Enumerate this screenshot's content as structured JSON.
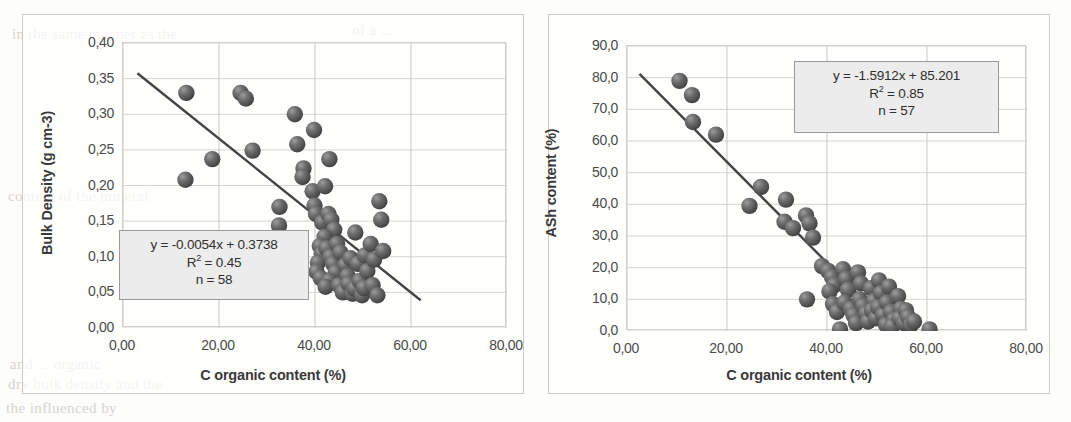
{
  "figure": {
    "panels": [
      "bulk-density-panel",
      "ash-content-panel"
    ],
    "background_ghost_text": [
      {
        "text": "in the same manner as the",
        "x": 12,
        "y": 26
      },
      {
        "text": "of a ...",
        "x": 352,
        "y": 22
      },
      {
        "text": "content of the mineral",
        "x": 8,
        "y": 188
      },
      {
        "text": "and ... organic",
        "x": 10,
        "y": 356
      },
      {
        "text": "dry bulk density and the",
        "x": 8,
        "y": 376
      },
      {
        "text": "the influenced by",
        "x": 6,
        "y": 400
      }
    ]
  },
  "chart_data": [
    {
      "id": "bulk-density",
      "type": "scatter",
      "title": "",
      "xlabel": "C organic content (%)",
      "ylabel": "Bulk Density (g cm-3)",
      "xlim": [
        0,
        80
      ],
      "ylim": [
        0,
        0.4
      ],
      "xticks": [
        "0,00",
        "20,00",
        "40,00",
        "60,00",
        "80,00"
      ],
      "xtick_values": [
        0,
        20,
        40,
        60,
        80
      ],
      "yticks": [
        "0,00",
        "0,05",
        "0,10",
        "0,15",
        "0,20",
        "0,25",
        "0,30",
        "0,35",
        "0,40"
      ],
      "ytick_values": [
        0,
        0.05,
        0.1,
        0.15,
        0.2,
        0.25,
        0.3,
        0.35,
        0.4
      ],
      "grid": true,
      "marker_color": "#5d5d5d",
      "trendline_color": "#444444",
      "annotation": {
        "equation": "y = -0.0054x + 0.3738",
        "r2_label": "R",
        "r2_exp": "2",
        "r2_value": " = 0.45",
        "n": "n = 58"
      },
      "trendline": {
        "slope": -0.0054,
        "intercept": 0.3738,
        "x_start": 3.0,
        "x_end": 62.0
      },
      "points": [
        [
          13.2,
          0.33
        ],
        [
          13.0,
          0.208
        ],
        [
          18.6,
          0.237
        ],
        [
          24.5,
          0.33
        ],
        [
          25.6,
          0.322
        ],
        [
          27.0,
          0.249
        ],
        [
          32.6,
          0.17
        ],
        [
          32.5,
          0.144
        ],
        [
          35.8,
          0.3
        ],
        [
          36.3,
          0.258
        ],
        [
          37.6,
          0.224
        ],
        [
          37.4,
          0.212
        ],
        [
          39.8,
          0.278
        ],
        [
          39.5,
          0.192
        ],
        [
          39.9,
          0.172
        ],
        [
          40.2,
          0.16
        ],
        [
          43.0,
          0.237
        ],
        [
          42.1,
          0.199
        ],
        [
          41.5,
          0.148
        ],
        [
          42.8,
          0.16
        ],
        [
          43.4,
          0.152
        ],
        [
          44.0,
          0.138
        ],
        [
          42.0,
          0.128
        ],
        [
          41.0,
          0.115
        ],
        [
          41.4,
          0.104
        ],
        [
          40.6,
          0.092
        ],
        [
          40.3,
          0.079
        ],
        [
          41.2,
          0.07
        ],
        [
          42.4,
          0.112
        ],
        [
          43.2,
          0.1
        ],
        [
          43.8,
          0.09
        ],
        [
          44.3,
          0.078
        ],
        [
          43.0,
          0.066
        ],
        [
          42.2,
          0.058
        ],
        [
          44.6,
          0.118
        ],
        [
          45.3,
          0.106
        ],
        [
          45.0,
          0.06
        ],
        [
          45.8,
          0.05
        ],
        [
          46.3,
          0.088
        ],
        [
          46.8,
          0.073
        ],
        [
          47.4,
          0.098
        ],
        [
          47.0,
          0.062
        ],
        [
          47.8,
          0.048
        ],
        [
          48.4,
          0.134
        ],
        [
          48.9,
          0.09
        ],
        [
          48.2,
          0.055
        ],
        [
          49.3,
          0.066
        ],
        [
          49.8,
          0.046
        ],
        [
          50.4,
          0.102
        ],
        [
          50.9,
          0.08
        ],
        [
          50.2,
          0.056
        ],
        [
          51.6,
          0.118
        ],
        [
          52.3,
          0.096
        ],
        [
          52.0,
          0.06
        ],
        [
          53.4,
          0.178
        ],
        [
          53.8,
          0.152
        ],
        [
          54.2,
          0.108
        ],
        [
          53.0,
          0.046
        ]
      ]
    },
    {
      "id": "ash-content",
      "type": "scatter",
      "title": "",
      "xlabel": "C organic content (%)",
      "ylabel": "ASh content (%)",
      "xlim": [
        0,
        80
      ],
      "ylim": [
        0,
        90
      ],
      "xticks": [
        "0,00",
        "20,00",
        "40,00",
        "60,00",
        "80,00"
      ],
      "xtick_values": [
        0,
        20,
        40,
        60,
        80
      ],
      "yticks": [
        "0,0",
        "10,0",
        "20,0",
        "30,0",
        "40,0",
        "50,0",
        "60,0",
        "70,0",
        "80,0",
        "90,0"
      ],
      "ytick_values": [
        0,
        10,
        20,
        30,
        40,
        50,
        60,
        70,
        80,
        90
      ],
      "grid": true,
      "marker_color": "#5d5d5d",
      "trendline_color": "#444444",
      "annotation": {
        "equation": "y = -1.5912x + 85.201",
        "r2_label": "R",
        "r2_exp": "2",
        "r2_value": " = 0.85",
        "n": "n = 57"
      },
      "trendline": {
        "slope": -1.5912,
        "intercept": 85.201,
        "x_start": 2.5,
        "x_end": 53.0
      },
      "points": [
        [
          10.5,
          79.0
        ],
        [
          13.0,
          74.5
        ],
        [
          13.2,
          66.0
        ],
        [
          17.8,
          62.0
        ],
        [
          24.5,
          39.5
        ],
        [
          26.8,
          45.5
        ],
        [
          31.8,
          41.5
        ],
        [
          31.5,
          34.5
        ],
        [
          33.2,
          32.5
        ],
        [
          35.8,
          36.5
        ],
        [
          36.5,
          34.0
        ],
        [
          37.2,
          29.5
        ],
        [
          36.0,
          10.0
        ],
        [
          39.0,
          20.5
        ],
        [
          40.2,
          19.0
        ],
        [
          41.0,
          17.0
        ],
        [
          41.5,
          14.5
        ],
        [
          40.5,
          12.5
        ],
        [
          41.2,
          8.5
        ],
        [
          42.0,
          6.0
        ],
        [
          42.6,
          0.5
        ],
        [
          43.2,
          19.5
        ],
        [
          43.8,
          16.5
        ],
        [
          44.2,
          13.0
        ],
        [
          43.5,
          9.0
        ],
        [
          44.8,
          7.0
        ],
        [
          45.3,
          5.0
        ],
        [
          45.8,
          2.5
        ],
        [
          46.2,
          18.5
        ],
        [
          46.8,
          15.0
        ],
        [
          46.5,
          10.0
        ],
        [
          47.2,
          8.0
        ],
        [
          47.8,
          5.5
        ],
        [
          48.2,
          3.0
        ],
        [
          48.8,
          13.5
        ],
        [
          49.4,
          9.5
        ],
        [
          49.0,
          6.5
        ],
        [
          49.8,
          4.0
        ],
        [
          50.4,
          16.0
        ],
        [
          50.8,
          12.0
        ],
        [
          50.2,
          7.5
        ],
        [
          51.2,
          5.0
        ],
        [
          51.8,
          2.0
        ],
        [
          52.4,
          14.0
        ],
        [
          52.0,
          9.0
        ],
        [
          52.8,
          6.0
        ],
        [
          53.4,
          3.5
        ],
        [
          53.0,
          1.5
        ],
        [
          54.2,
          11.0
        ],
        [
          54.8,
          7.0
        ],
        [
          54.5,
          4.0
        ],
        [
          55.4,
          2.5
        ],
        [
          55.8,
          6.5
        ],
        [
          56.2,
          4.5
        ],
        [
          56.8,
          2.0
        ],
        [
          57.4,
          3.0
        ],
        [
          60.5,
          0.5
        ]
      ]
    }
  ]
}
